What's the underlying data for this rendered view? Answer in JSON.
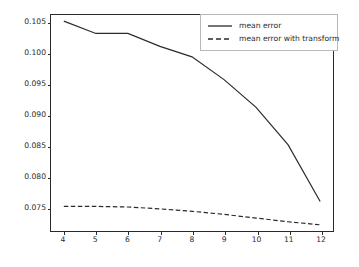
{
  "chart_data": {
    "type": "line",
    "title": "",
    "xlabel": "",
    "ylabel": "",
    "x": [
      4,
      5,
      6,
      7,
      8,
      9,
      10,
      11,
      12
    ],
    "xlim": [
      3.6,
      12.4
    ],
    "ylim": [
      0.0712,
      0.1063
    ],
    "grid": false,
    "legend_position": "upper right",
    "xticks": [
      "4",
      "5",
      "6",
      "7",
      "8",
      "9",
      "10",
      "11",
      "12"
    ],
    "xtick_values": [
      4,
      5,
      6,
      7,
      8,
      9,
      10,
      11,
      12
    ],
    "yticks": [
      "0.075",
      "0.080",
      "0.085",
      "0.090",
      "0.095",
      "0.100",
      "0.105"
    ],
    "ytick_values": [
      0.075,
      0.08,
      0.085,
      0.09,
      0.095,
      0.1,
      0.105
    ],
    "series": [
      {
        "name": "mean error",
        "style": "solid",
        "color": "#2b2b2b",
        "values": [
          0.1053,
          0.1033,
          0.1033,
          0.1012,
          0.0995,
          0.0958,
          0.0913,
          0.0852,
          0.076
        ]
      },
      {
        "name": "mean error with transform",
        "style": "dashed",
        "color": "#2b2b2b",
        "values": [
          0.0752,
          0.0752,
          0.0751,
          0.0748,
          0.0744,
          0.0739,
          0.0733,
          0.0727,
          0.0722
        ]
      }
    ]
  },
  "legend": {
    "entries": [
      {
        "label": "mean error"
      },
      {
        "label": "mean error with transform"
      }
    ]
  },
  "colors": {
    "line": "#2b2b2b",
    "axis": "#2b2b2b",
    "legend_border": "#b8b8b8",
    "background": "#ffffff"
  }
}
